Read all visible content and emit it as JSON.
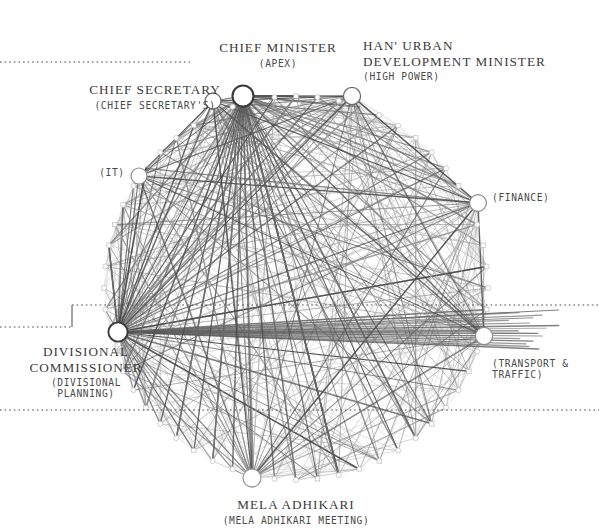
{
  "diagram": {
    "type": "circular-node-link",
    "background": "#ffffff",
    "ink": "#3b3b3b"
  },
  "labels": [
    {
      "id": "chief-minister",
      "main": "CHIEF MINISTER",
      "sub": "(APEX)",
      "align": "center",
      "x": 278,
      "y": 40
    },
    {
      "id": "han-urban-development-minister",
      "main": "HAN' URBAN\nDEVELOPMENT MINISTER",
      "sub": "(HIGH POWER)",
      "align": "left",
      "x": 363,
      "y": 38
    },
    {
      "id": "chief-secretary",
      "main": "CHIEF SECRETARY",
      "sub": "(CHIEF SECRETARY'S)",
      "align": "center",
      "x": 155,
      "y": 82
    },
    {
      "id": "it",
      "main": "",
      "sub": "(IT)",
      "align": "center",
      "x": 112,
      "y": 165
    },
    {
      "id": "finance",
      "main": "",
      "sub": "(FINANCE)",
      "align": "left",
      "x": 492,
      "y": 190
    },
    {
      "id": "divisional-commissioner",
      "main": "DIVISIONAL\nCOMMISSIONER",
      "sub": "(DIVISIONAL\nPLANNING)",
      "align": "center",
      "x": 86,
      "y": 344
    },
    {
      "id": "transport-traffic",
      "main": "",
      "sub": "(TRANSPORT &\nTRAFFIC)",
      "align": "left",
      "x": 492,
      "y": 356
    },
    {
      "id": "mela-adhikari",
      "main": "MELA ADHIKARI",
      "sub": "(MELA ADHIKARI MEETING)",
      "align": "center",
      "x": 296,
      "y": 497
    }
  ],
  "chart_data": {
    "type": "network",
    "layout": "circular",
    "center": {
      "x": 296,
      "y": 288
    },
    "radius": 192,
    "node_count": 56,
    "hub_nodes": [
      {
        "id": "chief-minister",
        "label": "CHIEF MINISTER",
        "group": "APEX",
        "x": 243,
        "y": 96,
        "r": 10.5,
        "stroke": "#3b3b3b",
        "weight": 2.1
      },
      {
        "id": "chief-secretary",
        "label": "CHIEF SECRETARY",
        "group": "CHIEF SECRETARY'S",
        "x": 213,
        "y": 101,
        "r": 8.0,
        "stroke": "#6d6d6d",
        "weight": 1.3
      },
      {
        "id": "han-urban-development-minister",
        "label": "HAN' URBAN DEV MINISTER",
        "group": "HIGH POWER",
        "x": 352,
        "y": 96,
        "r": 8.6,
        "stroke": "#6d6d6d",
        "weight": 1.3
      },
      {
        "id": "it",
        "label": "IT",
        "group": "IT",
        "x": 139,
        "y": 176,
        "r": 8.0,
        "stroke": "#8a8a8a",
        "weight": 1.2
      },
      {
        "id": "finance",
        "label": "FINANCE",
        "group": "FINANCE",
        "x": 478,
        "y": 203,
        "r": 8.4,
        "stroke": "#8a8a8a",
        "weight": 1.2
      },
      {
        "id": "divisional-commissioner",
        "label": "DIVISIONAL COMMISSIONER",
        "group": "DIVISIONAL PLANNING",
        "x": 118,
        "y": 332,
        "r": 9.6,
        "stroke": "#3b3b3b",
        "weight": 1.9
      },
      {
        "id": "transport-traffic",
        "label": "TRANSPORT & TRAFFIC",
        "group": "TRANSPORT & TRAFFIC",
        "x": 484,
        "y": 336,
        "r": 8.6,
        "stroke": "#8a8a8a",
        "weight": 1.2
      },
      {
        "id": "mela-adhikari",
        "label": "MELA ADHIKARI",
        "group": "MELA ADHIKARI MEETING",
        "x": 252,
        "y": 478,
        "r": 9.0,
        "stroke": "#9a9a9a",
        "weight": 1.3
      }
    ],
    "guides": [
      {
        "id": "guide-top",
        "y": 62,
        "x1": 0,
        "x2": 190,
        "style": "dotted"
      },
      {
        "id": "guide-mid",
        "y": 305,
        "x1": 72,
        "x2": 599,
        "style": "dotted"
      },
      {
        "id": "guide-leader",
        "y": 327,
        "x1": 0,
        "x2": 72,
        "style": "dotted"
      },
      {
        "id": "guide-bottom",
        "y": 410,
        "x1": 0,
        "x2": 599,
        "style": "dotted"
      },
      {
        "id": "guide-tick",
        "x": 72,
        "y1": 305,
        "y2": 327,
        "style": "solid"
      }
    ],
    "edge_count": 210,
    "edge_shades": [
      "#4a4a4a",
      "#6e6e6e",
      "#8f8f8f",
      "#b0b0b0",
      "#cfcfcf",
      "#e2e2e2"
    ]
  }
}
